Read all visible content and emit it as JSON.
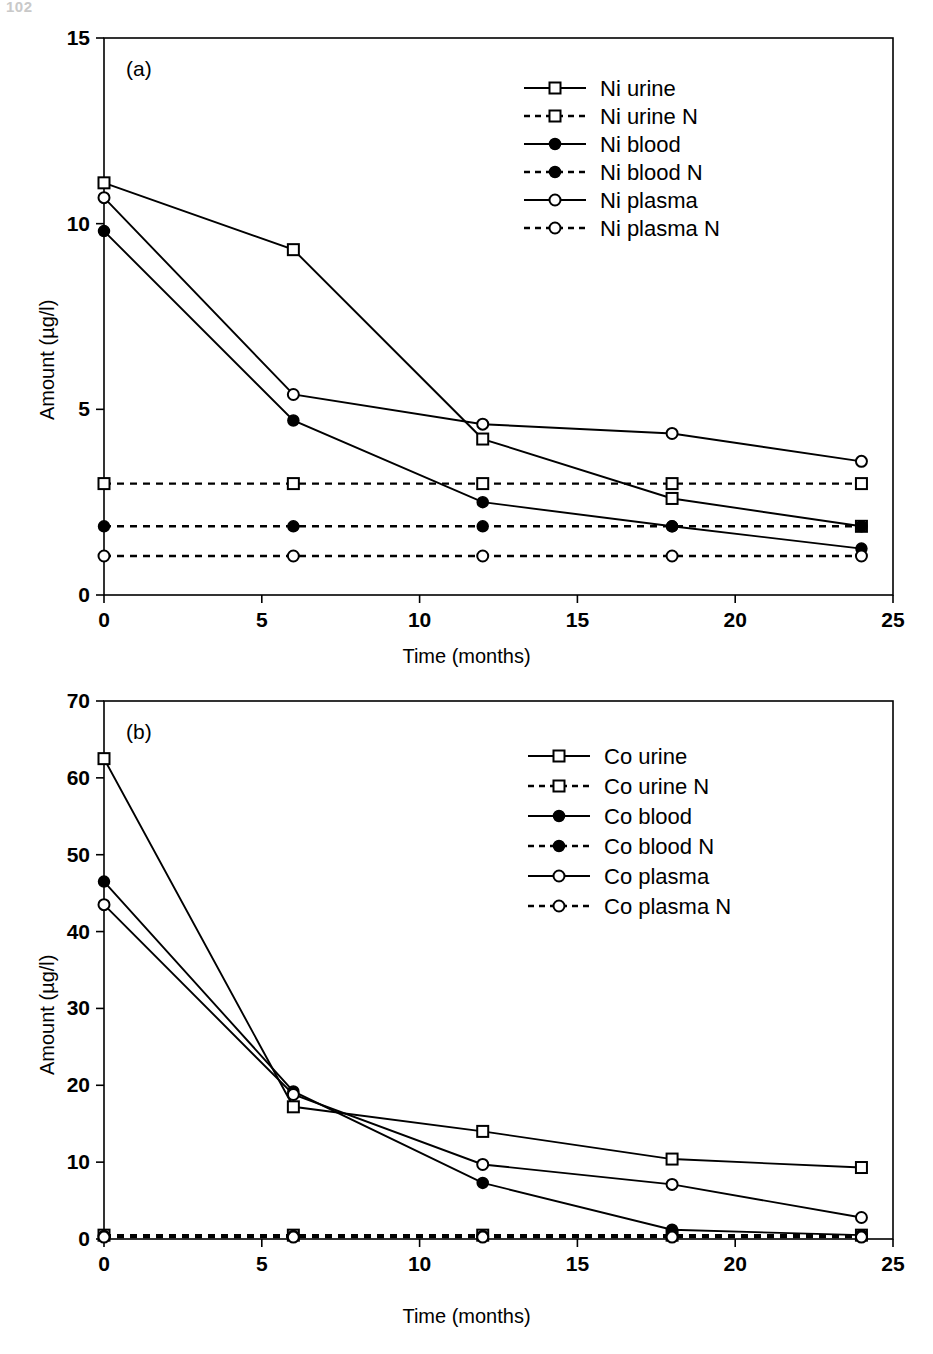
{
  "page": {
    "number": "102"
  },
  "axis": {
    "xlabel": "Time (months)",
    "ylabel": "Amount (µg/l)",
    "xticks": [
      "0",
      "5",
      "10",
      "15",
      "20",
      "25"
    ],
    "yticks_a": [
      "0",
      "5",
      "10",
      "15"
    ],
    "yticks_b": [
      "0",
      "10",
      "20",
      "30",
      "40",
      "50",
      "60",
      "70"
    ]
  },
  "panels": {
    "a": {
      "tag": "(a)"
    },
    "b": {
      "tag": "(b)"
    }
  },
  "legend_a": [
    {
      "label": "Ni urine",
      "marker": "open-square",
      "line": "solid"
    },
    {
      "label": "Ni urine N",
      "marker": "open-square",
      "line": "dashed"
    },
    {
      "label": "Ni blood",
      "marker": "filled-circle",
      "line": "solid"
    },
    {
      "label": "Ni blood N",
      "marker": "filled-circle",
      "line": "dashed"
    },
    {
      "label": "Ni plasma",
      "marker": "open-circle",
      "line": "solid"
    },
    {
      "label": "Ni plasma N",
      "marker": "open-circle",
      "line": "dashed"
    }
  ],
  "legend_b": [
    {
      "label": "Co urine",
      "marker": "open-square",
      "line": "solid"
    },
    {
      "label": "Co urine N",
      "marker": "open-square",
      "line": "dashed"
    },
    {
      "label": "Co blood",
      "marker": "filled-circle",
      "line": "solid"
    },
    {
      "label": "Co blood N",
      "marker": "filled-circle",
      "line": "dashed"
    },
    {
      "label": "Co plasma",
      "marker": "open-circle",
      "line": "solid"
    },
    {
      "label": "Co plasma N",
      "marker": "open-circle",
      "line": "dashed"
    }
  ],
  "chart_data": [
    {
      "type": "line",
      "panel": "(a)",
      "title": "Nickel concentrations over time",
      "xlabel": "Time (months)",
      "ylabel": "Amount (µg/l)",
      "xlim": [
        0,
        25
      ],
      "ylim": [
        0,
        15
      ],
      "xticks": [
        0,
        5,
        10,
        15,
        20,
        25
      ],
      "yticks": [
        0,
        5,
        10,
        15
      ],
      "grid": false,
      "legend_position": "top-right",
      "x": [
        0,
        6,
        12,
        18,
        24
      ],
      "series": [
        {
          "name": "Ni urine",
          "marker": "open-square",
          "line": "solid",
          "values": [
            11.1,
            9.3,
            4.2,
            2.6,
            1.85
          ]
        },
        {
          "name": "Ni urine N",
          "marker": "open-square",
          "line": "dashed",
          "values": [
            3.0,
            3.0,
            3.0,
            3.0,
            3.0
          ]
        },
        {
          "name": "Ni blood",
          "marker": "filled-circle",
          "line": "solid",
          "values": [
            9.8,
            4.7,
            2.5,
            1.85,
            1.25
          ]
        },
        {
          "name": "Ni blood N",
          "marker": "filled-circle",
          "line": "dashed",
          "values": [
            1.85,
            1.85,
            1.85,
            1.85,
            1.85
          ]
        },
        {
          "name": "Ni plasma",
          "marker": "open-circle",
          "line": "solid",
          "values": [
            10.7,
            5.4,
            4.6,
            4.35,
            3.6
          ]
        },
        {
          "name": "Ni plasma N",
          "marker": "open-circle",
          "line": "dashed",
          "values": [
            1.05,
            1.05,
            1.05,
            1.05,
            1.05
          ]
        }
      ]
    },
    {
      "type": "line",
      "panel": "(b)",
      "title": "Cobalt concentrations over time",
      "xlabel": "Time (months)",
      "ylabel": "Amount (µg/l)",
      "xlim": [
        0,
        25
      ],
      "ylim": [
        0,
        70
      ],
      "xticks": [
        0,
        5,
        10,
        15,
        20,
        25
      ],
      "yticks": [
        0,
        10,
        20,
        30,
        40,
        50,
        60,
        70
      ],
      "grid": false,
      "legend_position": "top-right",
      "x": [
        0,
        6,
        12,
        18,
        24
      ],
      "series": [
        {
          "name": "Co urine",
          "marker": "open-square",
          "line": "solid",
          "values": [
            62.5,
            17.2,
            14.0,
            10.4,
            9.3
          ]
        },
        {
          "name": "Co urine N",
          "marker": "open-square",
          "line": "dashed",
          "values": [
            0.5,
            0.5,
            0.5,
            0.5,
            0.5
          ]
        },
        {
          "name": "Co blood",
          "marker": "filled-circle",
          "line": "solid",
          "values": [
            46.5,
            19.2,
            7.3,
            1.2,
            0.5
          ]
        },
        {
          "name": "Co blood N",
          "marker": "filled-circle",
          "line": "dashed",
          "values": [
            0.4,
            0.4,
            0.4,
            0.4,
            0.4
          ]
        },
        {
          "name": "Co plasma",
          "marker": "open-circle",
          "line": "solid",
          "values": [
            43.5,
            18.8,
            9.7,
            7.1,
            2.8
          ]
        },
        {
          "name": "Co plasma N",
          "marker": "open-circle",
          "line": "dashed",
          "values": [
            0.25,
            0.25,
            0.25,
            0.25,
            0.25
          ]
        }
      ]
    }
  ]
}
